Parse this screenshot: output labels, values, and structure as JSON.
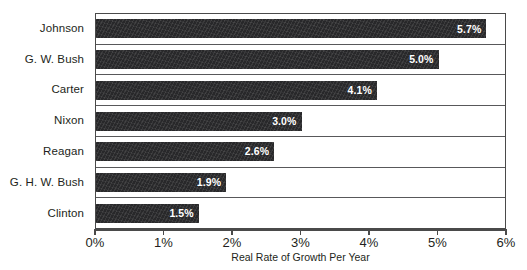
{
  "chart_data": {
    "type": "bar",
    "orientation": "horizontal",
    "title": "",
    "xlabel": "Real Rate of Growth Per Year",
    "ylabel": "",
    "xlim": [
      0,
      6
    ],
    "xtick_labels": [
      "0%",
      "1%",
      "2%",
      "3%",
      "4%",
      "5%",
      "6%"
    ],
    "xtick_values": [
      0,
      1,
      2,
      3,
      4,
      5,
      6
    ],
    "grid": false,
    "legend": null,
    "categories": [
      "Johnson",
      "G. W. Bush",
      "Carter",
      "Nixon",
      "Reagan",
      "G. H. W. Bush",
      "Clinton"
    ],
    "values": [
      5.7,
      5.0,
      4.1,
      3.0,
      2.6,
      1.9,
      1.5
    ],
    "data_labels": [
      "5.7%",
      "5.0%",
      "4.1%",
      "3.0%",
      "2.6%",
      "1.9%",
      "1.5%"
    ],
    "bar_color": "#28282a",
    "data_label_color": "#ffffff",
    "axis_color": "#4a4a4a",
    "background_color": "#ffffff"
  }
}
